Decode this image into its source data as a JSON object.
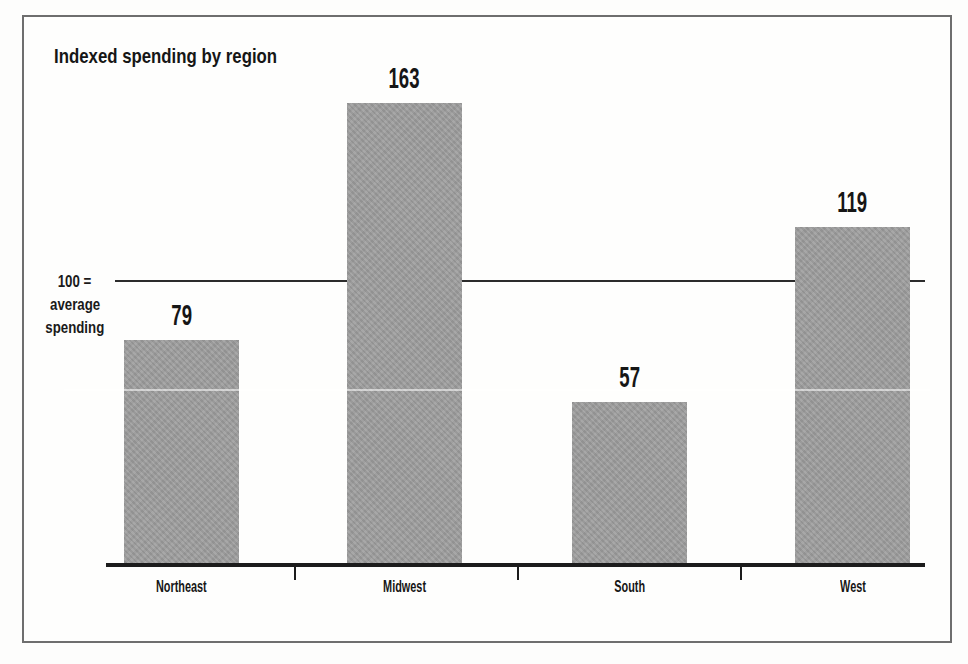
{
  "chart": {
    "ref_label_lines": [
      "100 =",
      "average",
      "spending"
    ]
  },
  "chart_data": {
    "type": "bar",
    "title": "Indexed spending by region",
    "categories": [
      "Northeast",
      "Midwest",
      "South",
      "West"
    ],
    "values": [
      79,
      163,
      57,
      119
    ],
    "xlabel": "",
    "ylabel": "",
    "reference_line": {
      "value": 100,
      "label": "100 = average spending"
    },
    "ylim": [
      0,
      200
    ],
    "grid": false,
    "legend": "none",
    "bar_color": "#9d9d9d",
    "line_color": "#2c2c2c",
    "text_color": "#161616"
  }
}
